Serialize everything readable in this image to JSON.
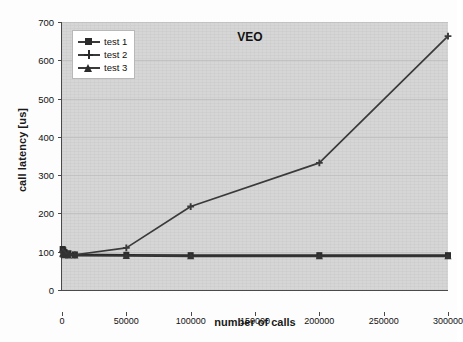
{
  "chart_data": {
    "type": "line",
    "title": "VEO",
    "xlabel": "number of calls",
    "ylabel": "call latency [us]",
    "xlim": [
      0,
      300000
    ],
    "ylim": [
      0,
      700
    ],
    "xticks": [
      0,
      50000,
      100000,
      150000,
      200000,
      250000,
      300000
    ],
    "xtick_labels": [
      "0",
      "50000",
      "100000",
      "150000",
      "200000",
      "250000",
      "300000"
    ],
    "yticks": [
      0,
      100,
      200,
      300,
      400,
      500,
      600,
      700
    ],
    "ytick_labels": [
      "0",
      "100",
      "200",
      "300",
      "400",
      "500",
      "600",
      "700"
    ],
    "grid": true,
    "legend_position": "upper-left",
    "series": [
      {
        "name": "test 1",
        "marker": "square",
        "color": "#2b2b2b",
        "x": [
          500,
          1000,
          2000,
          5000,
          10000,
          50000,
          100000,
          200000,
          300000
        ],
        "y": [
          107,
          104,
          99,
          96,
          93,
          92,
          91,
          91,
          91
        ]
      },
      {
        "name": "test 2",
        "marker": "cross",
        "color": "#3a3a3a",
        "x": [
          500,
          1000,
          2000,
          5000,
          10000,
          50000,
          100000,
          200000,
          300000
        ],
        "y": [
          100,
          97,
          95,
          93,
          92,
          110,
          218,
          332,
          663
        ]
      },
      {
        "name": "test 3",
        "marker": "triangle",
        "color": "#333333",
        "x": [
          500,
          1000,
          2000,
          5000,
          10000,
          50000,
          100000,
          200000,
          300000
        ],
        "y": [
          95,
          93,
          91,
          90,
          90,
          89,
          88,
          88,
          88
        ]
      }
    ]
  },
  "axes": {
    "y_title": "call latency [us]",
    "x_title": "number of calls"
  },
  "legend": {
    "items": [
      {
        "label": "test 1"
      },
      {
        "label": "test 2"
      },
      {
        "label": "test 3"
      }
    ]
  },
  "colors": {
    "plot_background": "#d6d6d6",
    "page_background": "#fdfdfd",
    "axis": "#4a4a4a",
    "gridline": "#c2c2c2",
    "series": "#2b2b2b"
  }
}
